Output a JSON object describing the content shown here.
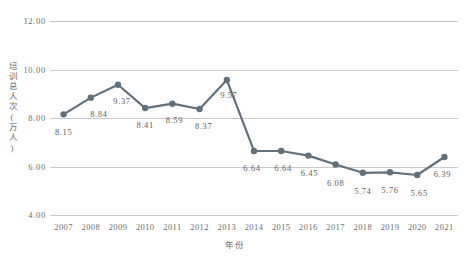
{
  "chart_data": {
    "type": "line",
    "title": "",
    "xlabel": "年份",
    "ylabel": "培训总人次(万人)",
    "categories": [
      "2007",
      "2008",
      "2009",
      "2010",
      "2011",
      "2012",
      "2013",
      "2014",
      "2015",
      "2016",
      "2017",
      "2018",
      "2019",
      "2020",
      "2021"
    ],
    "values": [
      8.15,
      8.84,
      9.37,
      8.41,
      8.59,
      8.37,
      9.57,
      6.64,
      6.64,
      6.45,
      6.08,
      5.74,
      5.76,
      5.65,
      6.39
    ],
    "data_labels": [
      "8.15",
      "8.84",
      "9.37",
      "8.41",
      "8.59",
      "8.37",
      "9.57",
      "6.64",
      "6.64",
      "6.45",
      "6.08",
      "5.74",
      "5.76",
      "5.65",
      "6.39"
    ],
    "ylim": [
      4.0,
      12.0
    ],
    "yticks": [
      12.0,
      10.0,
      8.0,
      6.0,
      4.0
    ],
    "ytick_labels": [
      "12.00",
      "10.00",
      "8.00",
      "6.00",
      "4.00"
    ],
    "grid": true,
    "legend": "none",
    "series_color": "#61707a",
    "grid_color": "#c9c9c9",
    "marker": "circle"
  }
}
